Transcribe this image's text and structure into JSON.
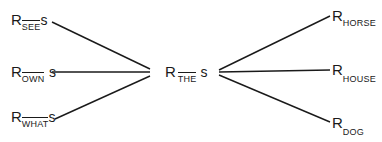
{
  "diagram": {
    "center": {
      "R": "R",
      "sub": "THE",
      "s": "s"
    },
    "left_nodes": [
      {
        "R": "R",
        "sub": "SEE",
        "s": "s"
      },
      {
        "R": "R",
        "sub": "OWN",
        "s": "s"
      },
      {
        "R": "R",
        "sub": "WHAT",
        "s": "s"
      }
    ],
    "right_nodes": [
      {
        "R": "R",
        "sub": "HORSE"
      },
      {
        "R": "R",
        "sub": "HOUSE"
      },
      {
        "R": "R",
        "sub": "DOG"
      }
    ],
    "line_color": "#1a1a1a"
  }
}
